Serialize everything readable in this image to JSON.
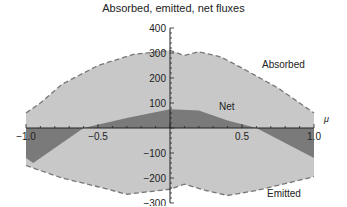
{
  "chart_data": {
    "type": "area",
    "title": "Absorbed, emitted, net fluxes",
    "xlabel": "μ",
    "ylabel": "",
    "xlim": [
      -1.0,
      1.0
    ],
    "ylim": [
      -300,
      400
    ],
    "x_ticks": [
      "-1.0",
      "-0.5",
      "0.5",
      "1.0"
    ],
    "y_ticks": [
      "400",
      "300",
      "200",
      "100",
      "-100",
      "-200",
      "-300"
    ],
    "grid": false,
    "legend": "inline annotations",
    "annotations": [
      "Absorbed",
      "Net",
      "Emitted"
    ],
    "series": [
      {
        "name": "Absorbed",
        "style": "dashed outline, light gray fill",
        "x": [
          -1.0,
          -0.9,
          -0.75,
          -0.5,
          -0.25,
          0.0,
          0.1,
          0.2,
          0.35,
          0.5,
          0.75,
          1.0
        ],
        "values": [
          60,
          100,
          175,
          250,
          295,
          310,
          290,
          305,
          285,
          240,
          160,
          60
        ]
      },
      {
        "name": "Emitted",
        "style": "dashed outline, light gray fill",
        "x": [
          -1.0,
          -0.75,
          -0.5,
          -0.3,
          0.0,
          0.1,
          0.25,
          0.4,
          0.6,
          1.0
        ],
        "values": [
          -150,
          -200,
          -235,
          -265,
          -245,
          -225,
          -250,
          -270,
          -250,
          -195
        ]
      },
      {
        "name": "Net",
        "style": "dark gray fill",
        "x": [
          -1.0,
          -0.95,
          -0.6,
          -0.3,
          0.0,
          0.2,
          0.4,
          0.6,
          0.9,
          1.0
        ],
        "values": [
          -120,
          -140,
          0,
          40,
          75,
          70,
          30,
          0,
          -90,
          -120
        ]
      }
    ],
    "colors": {
      "light_fill": "#c8c8c8",
      "net_fill": "#7a7a7a",
      "outline": "#777777"
    }
  }
}
